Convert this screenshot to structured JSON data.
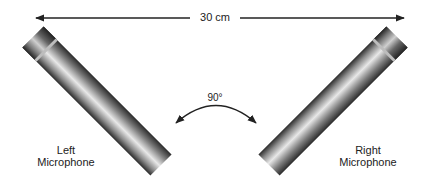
{
  "diagram": {
    "distance": {
      "label": "30 cm"
    },
    "angle": {
      "label": "90°"
    },
    "microphones": [
      {
        "label_line1": "Left",
        "label_line2": "Microphone"
      },
      {
        "label_line1": "Right",
        "label_line2": "Microphone"
      }
    ],
    "colors": {
      "arrow": "#222222",
      "mic_dark": "#2e2e2e",
      "mic_light": "#e6e6e6",
      "text": "#222222"
    }
  }
}
